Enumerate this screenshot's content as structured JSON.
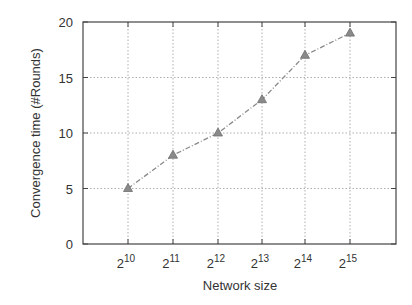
{
  "chart_data": {
    "type": "line",
    "title": "",
    "xlabel": "Network size",
    "ylabel": "Convergence time (#Rounds)",
    "x": [
      "2^10",
      "2^11",
      "2^12",
      "2^13",
      "2^14",
      "2^15"
    ],
    "x_tick_labels": [
      {
        "base": "2",
        "exp": "10"
      },
      {
        "base": "2",
        "exp": "11"
      },
      {
        "base": "2",
        "exp": "12"
      },
      {
        "base": "2",
        "exp": "13"
      },
      {
        "base": "2",
        "exp": "14"
      },
      {
        "base": "2",
        "exp": "15"
      }
    ],
    "series": [
      {
        "name": "Convergence time",
        "values": [
          5,
          8,
          10,
          13,
          17,
          19
        ],
        "marker": "triangle",
        "line_style": "dash-dot",
        "color": "#8a8a8a"
      }
    ],
    "y_ticks": [
      0,
      5,
      10,
      15,
      20
    ],
    "ylim": [
      0,
      20
    ],
    "grid": true,
    "legend": null
  },
  "colors": {
    "axis": "#444444",
    "grid": "#9a9a9a",
    "series": "#8a8a8a",
    "text": "#333333"
  }
}
